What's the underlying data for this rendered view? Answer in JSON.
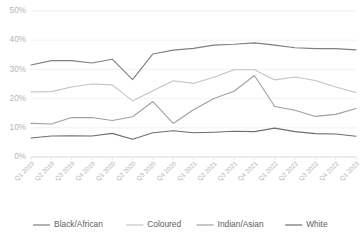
{
  "chart_data": {
    "type": "line",
    "title": "",
    "subtitle": "",
    "xlabel": "",
    "ylabel": "",
    "ylim": [
      0,
      50
    ],
    "ytick_labels": [
      "0%",
      "10%",
      "20%",
      "30%",
      "40%",
      "50%"
    ],
    "ytick_values": [
      0,
      10,
      20,
      30,
      40,
      50
    ],
    "grid": true,
    "legend_position": "bottom",
    "categories": [
      "Q1 2019",
      "Q2 2019",
      "Q3 2019",
      "Q4 2019",
      "Q1 2020",
      "Q2 2020",
      "Q3 2020",
      "Q4 2020",
      "Q1 2021",
      "Q2 2021",
      "Q3 2021",
      "Q4 2021",
      "Q1 2022",
      "Q2 2022",
      "Q3 2022",
      "Q4 2022",
      "Q1 2023"
    ],
    "series": [
      {
        "name": "Black/African",
        "color": "#7f7f7f",
        "values": [
          31.5,
          33.0,
          33.0,
          32.2,
          33.5,
          26.5,
          35.3,
          36.6,
          37.2,
          38.3,
          38.6,
          39.1,
          38.3,
          37.4,
          37.1,
          37.1,
          36.7
        ]
      },
      {
        "name": "Coloured",
        "color": "#c4c4c4",
        "values": [
          22.3,
          22.4,
          24.0,
          25.0,
          24.7,
          19.2,
          22.7,
          26.1,
          25.2,
          27.3,
          29.9,
          29.9,
          26.4,
          27.4,
          26.2,
          24.0,
          22.1
        ]
      },
      {
        "name": "Indian/Asian",
        "color": "#a0a0a0",
        "values": [
          11.5,
          11.3,
          13.5,
          13.5,
          12.5,
          13.8,
          19.0,
          11.5,
          16.2,
          20.0,
          22.5,
          27.9,
          17.3,
          16.0,
          13.9,
          14.6,
          16.6
        ]
      },
      {
        "name": "White",
        "color": "#6e6e6e",
        "values": [
          6.5,
          7.2,
          7.3,
          7.2,
          8.1,
          6.1,
          8.3,
          9.0,
          8.3,
          8.5,
          8.8,
          8.7,
          9.9,
          8.7,
          8.0,
          7.9,
          7.1
        ]
      }
    ]
  }
}
